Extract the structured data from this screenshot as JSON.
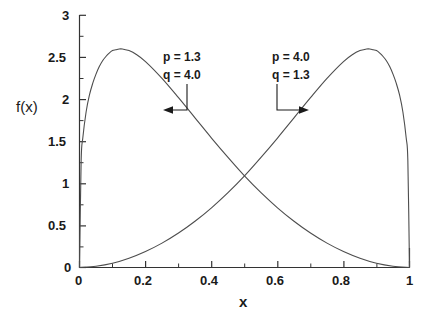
{
  "chart_data": {
    "type": "line",
    "title": "",
    "xlabel": "x",
    "ylabel": "f(x)",
    "xlim": [
      0,
      1
    ],
    "ylim": [
      0,
      3
    ],
    "grid": false,
    "legend_position": "none",
    "x_ticks": [
      "0",
      "0.2",
      "0.4",
      "0.6",
      "0.8",
      "1"
    ],
    "x_tick_values": [
      0,
      0.2,
      0.4,
      0.6,
      0.8,
      1
    ],
    "y_ticks": [
      "0",
      "0.5",
      "1",
      "1.5",
      "2",
      "2.5",
      "3"
    ],
    "y_tick_values": [
      0,
      0.5,
      1,
      1.5,
      2,
      2.5,
      3
    ],
    "x_minor_tick_values": [
      0.1,
      0.3,
      0.5,
      0.7,
      0.9
    ],
    "y_minor_tick_values": [
      0.25,
      0.75,
      1.25,
      1.75,
      2.25,
      2.75
    ],
    "line_color": "#4d4d4d",
    "axis_color": "#333333",
    "background": "#ffffff",
    "series": [
      {
        "name": "Beta(p=1.3, q=4.0)",
        "p": 1.3,
        "q": 4.0,
        "peak_x": 0.1,
        "peak_y": 2.6,
        "x": [
          0.0,
          0.005,
          0.01,
          0.02,
          0.03,
          0.04,
          0.05,
          0.06,
          0.07,
          0.08,
          0.09,
          0.1,
          0.11,
          0.12,
          0.13,
          0.14,
          0.15,
          0.17,
          0.2,
          0.25,
          0.3,
          0.35,
          0.4,
          0.45,
          0.5,
          0.55,
          0.6,
          0.65,
          0.7,
          0.75,
          0.8,
          0.85,
          0.9,
          0.95,
          1.0
        ],
        "y": [
          0.0,
          1.27,
          1.54,
          1.85,
          2.05,
          2.19,
          2.3,
          2.39,
          2.46,
          2.51,
          2.55,
          2.58,
          2.59,
          2.6,
          2.6,
          2.59,
          2.58,
          2.54,
          2.45,
          2.25,
          2.02,
          1.78,
          1.54,
          1.31,
          1.09,
          0.89,
          0.71,
          0.55,
          0.41,
          0.29,
          0.19,
          0.11,
          0.05,
          0.015,
          0.0
        ]
      },
      {
        "name": "Beta(p=4.0, q=1.3)",
        "p": 4.0,
        "q": 1.3,
        "peak_x": 0.9,
        "peak_y": 2.6,
        "x": [
          0.0,
          0.05,
          0.1,
          0.15,
          0.2,
          0.25,
          0.3,
          0.35,
          0.4,
          0.45,
          0.5,
          0.55,
          0.6,
          0.65,
          0.7,
          0.75,
          0.8,
          0.83,
          0.85,
          0.86,
          0.87,
          0.88,
          0.89,
          0.9,
          0.91,
          0.92,
          0.93,
          0.94,
          0.95,
          0.96,
          0.97,
          0.98,
          0.99,
          0.995,
          1.0
        ],
        "y": [
          0.0,
          0.015,
          0.05,
          0.11,
          0.19,
          0.29,
          0.41,
          0.55,
          0.71,
          0.89,
          1.09,
          1.31,
          1.54,
          1.78,
          2.02,
          2.25,
          2.45,
          2.54,
          2.58,
          2.59,
          2.6,
          2.6,
          2.59,
          2.58,
          2.55,
          2.51,
          2.46,
          2.39,
          2.3,
          2.19,
          2.05,
          1.85,
          1.54,
          1.27,
          0.0
        ]
      }
    ],
    "annotations": [
      {
        "id": "left-annotation",
        "lines": [
          "p = 1.3",
          "q = 4.0"
        ],
        "arrow_direction": "left",
        "points_to_series": "Beta(p=1.3, q=4.0)"
      },
      {
        "id": "right-annotation",
        "lines": [
          "p = 4.0",
          "q = 1.3"
        ],
        "arrow_direction": "right",
        "points_to_series": "Beta(p=4.0, q=1.3)"
      }
    ]
  }
}
